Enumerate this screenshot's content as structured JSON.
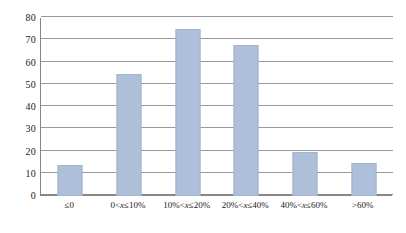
{
  "chart_data": {
    "type": "bar",
    "title": "",
    "subtitle": "",
    "xlabel": "",
    "ylabel": "",
    "categories": [
      "≤0",
      "0<x≤10%",
      "10%<x≤20%",
      "20%<x≤40%",
      "40%<x≤60%",
      ">60%"
    ],
    "values": [
      14,
      55,
      75,
      68,
      20,
      15
    ],
    "ylim": [
      0,
      80
    ],
    "ytick_labels": [
      "0",
      "10",
      "20",
      "30",
      "40",
      "50",
      "60",
      "70",
      "80"
    ],
    "ytick_values": [
      0,
      10,
      20,
      30,
      40,
      50,
      60,
      70,
      80
    ],
    "grid": "horizontal",
    "legend": "none",
    "bar_color": "#aebfd9",
    "bar_border_color": "#a2b4d0",
    "gridline_color": "#9a9a9a",
    "axis_color": "#868686",
    "background_color": "#ffffff"
  }
}
